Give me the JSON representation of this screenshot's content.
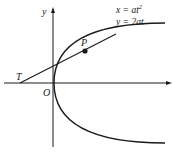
{
  "diagram": {
    "type": "parabola-tangent",
    "axes": {
      "x_label": "",
      "y_label": "y",
      "origin_label": "O"
    },
    "equations": {
      "line1": "x = at",
      "line1_sup": "2",
      "line2": "y = 2at"
    },
    "points": {
      "P": "P",
      "T": "T"
    },
    "colors": {
      "stroke": "#1a1a1a",
      "background": "#ffffff"
    }
  }
}
